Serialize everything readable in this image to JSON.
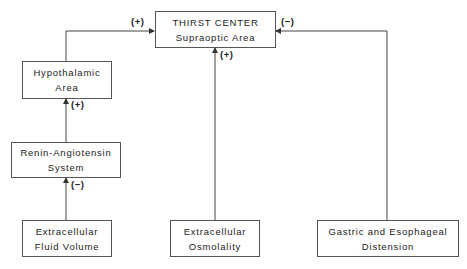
{
  "nodes": {
    "thirst_center": {
      "line1": "THIRST CENTER",
      "line2": "Supraoptic Area"
    },
    "hypothalamic": {
      "line1": "Hypothalamic",
      "line2": "Area"
    },
    "renin": {
      "line1": "Renin-Angiotensin",
      "line2": "System"
    },
    "ecf_volume": {
      "line1": "Extracellular",
      "line2": "Fluid Volume"
    },
    "osmolality": {
      "line1": "Extracellular",
      "line2": "Osmolality"
    },
    "gastric": {
      "line1": "Gastric and Esophageal",
      "line2": "Distension"
    }
  },
  "edges": {
    "hypothalamic_to_thirst": "(+)",
    "gastric_to_thirst": "(−)",
    "osmolality_to_thirst": "(+)",
    "renin_to_hypothalamic": "(+)",
    "ecf_to_renin": "(−)"
  }
}
